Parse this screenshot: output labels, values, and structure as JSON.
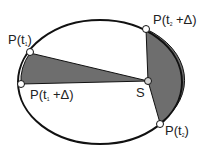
{
  "diagram": {
    "colors": {
      "sector": "#6e6e6e",
      "stroke": "#111111",
      "point_fill": "#ffffff",
      "sun_fill": "#cfcfcf"
    },
    "labels": {
      "p1": {
        "pre": "P(t",
        "sub": "1",
        "post": ")"
      },
      "p1d": {
        "pre": "P(t",
        "sub": "1",
        "post": " +Δ)"
      },
      "p2": {
        "pre": "P(t",
        "sub": "2",
        "post": ")"
      },
      "p2d": {
        "pre": "P(t",
        "sub": "2",
        "post": " +Δ)"
      },
      "sun": "S"
    }
  }
}
